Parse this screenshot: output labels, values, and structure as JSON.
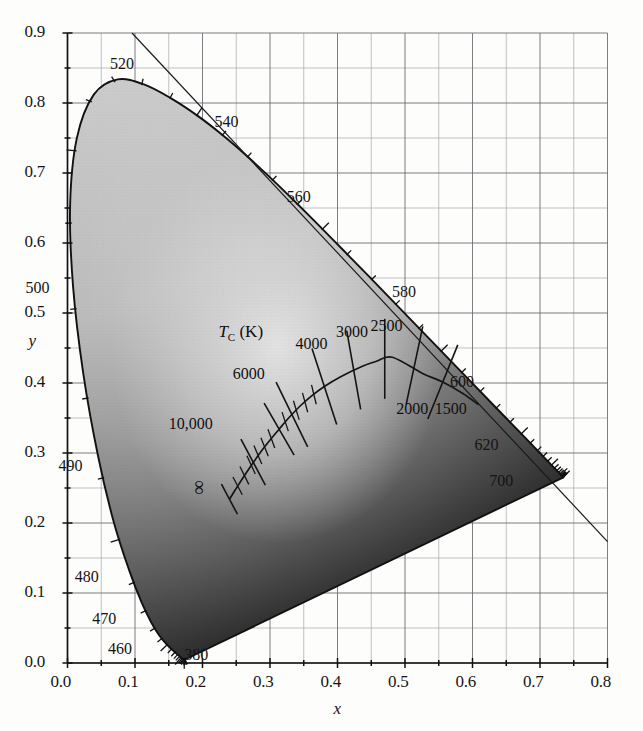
{
  "figure": {
    "kind": "cie-1931-chromaticity-diagram",
    "background": "#fdfdfc",
    "grid_color": "#8f8f93",
    "locus_color": "#111111"
  },
  "axes": {
    "x_title": "x",
    "y_title": "y",
    "x_ticks": [
      "0.0",
      "0.1",
      "0.2",
      "0.3",
      "0.4",
      "0.5",
      "0.6",
      "0.7",
      "0.8"
    ],
    "y_ticks": [
      "0.0",
      "0.1",
      "0.2",
      "0.3",
      "0.4",
      "0.5",
      "0.6",
      "0.7",
      "0.8",
      "0.9"
    ],
    "x_range": [
      0.0,
      0.8
    ],
    "y_range": [
      0.0,
      0.9
    ],
    "major_step": 0.1,
    "minor_step": 0.05,
    "grid": true
  },
  "spectral_labels": [
    {
      "text": "520",
      "x": 0.088,
      "y": 0.855
    },
    {
      "text": "540",
      "x": 0.243,
      "y": 0.772
    },
    {
      "text": "560",
      "x": 0.35,
      "y": 0.665
    },
    {
      "text": "580",
      "x": 0.506,
      "y": 0.528
    },
    {
      "text": "600",
      "x": 0.592,
      "y": 0.4
    },
    {
      "text": "620",
      "x": 0.628,
      "y": 0.31
    },
    {
      "text": "700",
      "x": 0.65,
      "y": 0.258
    },
    {
      "text": "500",
      "x": -0.037,
      "y": 0.535
    },
    {
      "text": "490",
      "x": 0.012,
      "y": 0.28
    },
    {
      "text": "480",
      "x": 0.036,
      "y": 0.122
    },
    {
      "text": "470",
      "x": 0.062,
      "y": 0.062
    },
    {
      "text": "460",
      "x": 0.085,
      "y": 0.018
    },
    {
      "text": "380",
      "x": 0.198,
      "y": 0.01
    }
  ],
  "temperature_locus": {
    "title": "T_C (K)",
    "title_main": "T",
    "title_sub": "C",
    "title_units": " (K)",
    "title_pos": {
      "x": 0.268,
      "y": 0.472
    },
    "labels": [
      {
        "text": "10,000",
        "x": 0.184,
        "y": 0.34
      },
      {
        "text": "6000",
        "x": 0.279,
        "y": 0.412
      },
      {
        "text": "4000",
        "x": 0.372,
        "y": 0.455
      },
      {
        "text": "3000",
        "x": 0.432,
        "y": 0.471
      },
      {
        "text": "2500",
        "x": 0.483,
        "y": 0.48
      },
      {
        "text": "2000",
        "x": 0.521,
        "y": 0.362
      },
      {
        "text": "1500",
        "x": 0.578,
        "y": 0.362
      }
    ],
    "infinity_symbol": "∞",
    "infinity_pos": {
      "x": 0.195,
      "y": 0.248
    }
  },
  "chart_data": {
    "type": "scatter",
    "title": "",
    "xlabel": "x",
    "ylabel": "y",
    "xlim": [
      0.0,
      0.8
    ],
    "ylim": [
      0.0,
      0.9
    ],
    "grid": true,
    "legend": "none",
    "series": [
      {
        "name": "Spectral locus (CIE 1931 2-deg)",
        "kind": "closed-curve",
        "points": [
          [
            0.1741,
            0.005
          ],
          [
            0.174,
            0.005
          ],
          [
            0.1738,
            0.0049
          ],
          [
            0.1736,
            0.0049
          ],
          [
            0.1733,
            0.0048
          ],
          [
            0.173,
            0.0048
          ],
          [
            0.1726,
            0.0048
          ],
          [
            0.1721,
            0.0048
          ],
          [
            0.1714,
            0.0051
          ],
          [
            0.1703,
            0.0058
          ],
          [
            0.1689,
            0.0069
          ],
          [
            0.1669,
            0.0086
          ],
          [
            0.1644,
            0.0109
          ],
          [
            0.1611,
            0.0138
          ],
          [
            0.1566,
            0.0177
          ],
          [
            0.151,
            0.0227
          ],
          [
            0.144,
            0.0297
          ],
          [
            0.1355,
            0.0399
          ],
          [
            0.1241,
            0.0578
          ],
          [
            0.1096,
            0.0868
          ],
          [
            0.0913,
            0.1327
          ],
          [
            0.0687,
            0.2007
          ],
          [
            0.0454,
            0.295
          ],
          [
            0.0235,
            0.4127
          ],
          [
            0.0082,
            0.5384
          ],
          [
            0.0039,
            0.6548
          ],
          [
            0.0139,
            0.7502
          ],
          [
            0.0389,
            0.812
          ],
          [
            0.0743,
            0.8338
          ],
          [
            0.1142,
            0.8262
          ],
          [
            0.1547,
            0.8059
          ],
          [
            0.1929,
            0.7816
          ],
          [
            0.2296,
            0.7543
          ],
          [
            0.2658,
            0.7243
          ],
          [
            0.3016,
            0.6923
          ],
          [
            0.3373,
            0.6589
          ],
          [
            0.3731,
            0.6245
          ],
          [
            0.4087,
            0.5896
          ],
          [
            0.4441,
            0.5547
          ],
          [
            0.4788,
            0.5202
          ],
          [
            0.5125,
            0.4866
          ],
          [
            0.5448,
            0.4544
          ],
          [
            0.5752,
            0.4242
          ],
          [
            0.6029,
            0.3965
          ],
          [
            0.627,
            0.3725
          ],
          [
            0.6482,
            0.3514
          ],
          [
            0.6658,
            0.334
          ],
          [
            0.6801,
            0.3197
          ],
          [
            0.6915,
            0.3083
          ],
          [
            0.7006,
            0.2993
          ],
          [
            0.7079,
            0.292
          ],
          [
            0.714,
            0.2859
          ],
          [
            0.719,
            0.2809
          ],
          [
            0.723,
            0.277
          ],
          [
            0.726,
            0.274
          ],
          [
            0.7283,
            0.2717
          ],
          [
            0.73,
            0.27
          ],
          [
            0.7311,
            0.2689
          ],
          [
            0.732,
            0.268
          ],
          [
            0.7327,
            0.2673
          ],
          [
            0.7334,
            0.2666
          ],
          [
            0.734,
            0.266
          ],
          [
            0.7344,
            0.2656
          ],
          [
            0.7346,
            0.2654
          ],
          [
            0.7347,
            0.2653
          ]
        ]
      },
      {
        "name": "Planckian locus",
        "kind": "open-curve",
        "points": [
          [
            0.2399,
            0.234
          ],
          [
            0.2516,
            0.252
          ],
          [
            0.2637,
            0.27
          ],
          [
            0.276,
            0.2875
          ],
          [
            0.2887,
            0.3045
          ],
          [
            0.3022,
            0.321
          ],
          [
            0.3135,
            0.334
          ],
          [
            0.3221,
            0.344
          ],
          [
            0.3324,
            0.355
          ],
          [
            0.345,
            0.3675
          ],
          [
            0.3608,
            0.381
          ],
          [
            0.3805,
            0.395
          ],
          [
            0.4047,
            0.409
          ],
          [
            0.4369,
            0.424
          ],
          [
            0.4578,
            0.431
          ],
          [
            0.4813,
            0.4368
          ],
          [
            0.5268,
            0.4133
          ],
          [
            0.5552,
            0.4018
          ],
          [
            0.5857,
            0.385
          ],
          [
            0.609,
            0.369
          ]
        ]
      }
    ],
    "annotations": [
      {
        "text": "T_C (K)",
        "role": "locus-title"
      },
      {
        "text": "10,000",
        "role": "temperature-tick"
      },
      {
        "text": "6000",
        "role": "temperature-tick"
      },
      {
        "text": "4000",
        "role": "temperature-tick"
      },
      {
        "text": "3000",
        "role": "temperature-tick"
      },
      {
        "text": "2500",
        "role": "temperature-tick"
      },
      {
        "text": "2000",
        "role": "temperature-tick"
      },
      {
        "text": "1500",
        "role": "temperature-tick"
      },
      {
        "text": "∞",
        "role": "temperature-tick"
      }
    ]
  }
}
